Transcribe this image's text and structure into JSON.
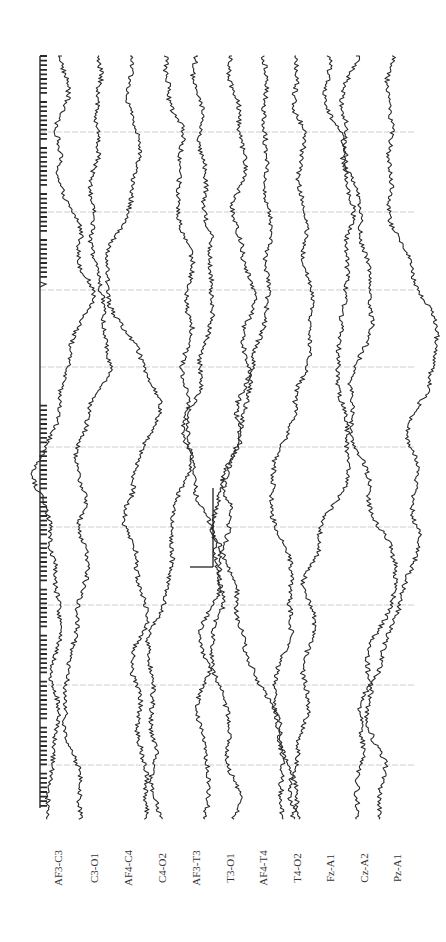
{
  "figure": {
    "type": "EEG multichannel trace (rotated 90°)",
    "orientation": "time axis runs top-to-bottom; channels arranged left-to-right",
    "trace_color": "#2a2a2a",
    "grid_color": "#cfcfcf",
    "background": "#ffffff"
  },
  "channels": [
    {
      "label": "AF3-C3",
      "x": 58,
      "trace_x": 62
    },
    {
      "label": "C3-O1",
      "x": 94,
      "trace_x": 98
    },
    {
      "label": "AF4-C4",
      "x": 128,
      "trace_x": 130
    },
    {
      "label": "C4-O2",
      "x": 162,
      "trace_x": 164
    },
    {
      "label": "AF3-T3",
      "x": 196,
      "trace_x": 196
    },
    {
      "label": "T3-O1",
      "x": 230,
      "trace_x": 232
    },
    {
      "label": "AF4-T4",
      "x": 263,
      "trace_x": 264
    },
    {
      "label": "T4-O2",
      "x": 297,
      "trace_x": 296
    },
    {
      "label": "Fz-A1",
      "x": 330,
      "trace_x": 328
    },
    {
      "label": "Cz-A2",
      "x": 364,
      "trace_x": 356
    },
    {
      "label": "Pz-A1",
      "x": 397,
      "trace_x": 392
    }
  ],
  "label_y": 868,
  "timing_marker": {
    "x": 40,
    "y_start": 56,
    "y_end": 808,
    "tick_spacing": 4.6,
    "gap": [
      282,
      404
    ]
  },
  "gridlines_y": [
    132,
    212,
    290,
    367,
    447,
    527,
    605,
    685,
    765
  ],
  "grid_x_range": [
    40,
    415
  ],
  "scale_bar": {
    "vertical": {
      "x": 213,
      "y1": 488,
      "y2": 567
    },
    "horizontal": {
      "x1": 190,
      "x2": 213,
      "y": 567
    }
  },
  "plot_region": {
    "y_start": 56,
    "y_end": 820
  }
}
